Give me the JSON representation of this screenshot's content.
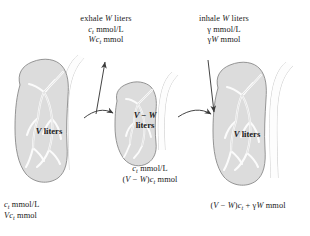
{
  "figure": {
    "name": "lung-ventilation-mass-balance-diagram",
    "colors": {
      "lung_fill": "#dcdcdc",
      "lung_stroke": "#8a8a8a",
      "bronchi_fill": "#fbfbfb",
      "bronchi_stroke": "#c9c9c9",
      "trachea_fill": "#fdfdfd",
      "trachea_stroke": "#b4b4b4",
      "arrow": "#3a3a3a",
      "text": "#1a1a1a",
      "background": "#ffffff"
    }
  },
  "captions": {
    "exhale": {
      "line1_pre": "exhale ",
      "line1_var": "W",
      "line1_post": " liters",
      "line2_var": "c",
      "line2_sub": "t",
      "line2_post": " mmol/L",
      "line3_var1": "Wc",
      "line3_sub": "t",
      "line3_post": " mmol"
    },
    "inhale": {
      "line1_pre": "inhale ",
      "line1_var": "W",
      "line1_post": " liters",
      "line2_var": "γ",
      "line2_post": " mmol/L",
      "line3_var1": "γ",
      "line3_var2": "W",
      "line3_post": " mmol"
    },
    "middle": {
      "line1_var": "c",
      "line1_sub": "t",
      "line1_post": " mmol/L",
      "line2_open": "(",
      "line2_v": "V",
      "line2_minus": " − ",
      "line2_w": "W",
      "line2_close": ")",
      "line2_c": "c",
      "line2_sub": "t",
      "line2_post": " mmol"
    },
    "left": {
      "line1_var": "c",
      "line1_sub": "t",
      "line1_post": " mmol/L",
      "line2_var": "Vc",
      "line2_sub": "t",
      "line2_post": " mmol"
    },
    "right": {
      "open": "(",
      "v": "V",
      "minus": " − ",
      "w": "W",
      "close": ")",
      "c": "c",
      "c_sub": "t",
      "plus": " + ",
      "gamma": "γ",
      "w2": "W",
      "unit": " mmol"
    }
  },
  "lung_labels": {
    "left": {
      "volume": "V",
      "unit": " liters"
    },
    "middle": {
      "line1_v": "V",
      "line1_minus": " − ",
      "line1_w": "W",
      "line2": "liters"
    },
    "right": {
      "volume": "V",
      "unit": " liters"
    }
  },
  "arrows": {
    "exhale_up": "exhale-arrow-up",
    "inhale_down": "inhale-arrow-down",
    "transition_left": "transition-arrow-left-to-middle",
    "transition_right": "transition-arrow-middle-to-right"
  }
}
